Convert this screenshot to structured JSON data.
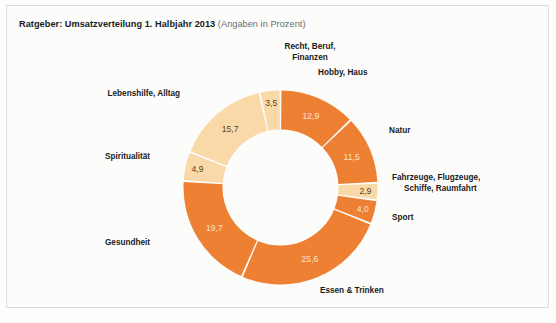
{
  "header": {
    "title_main": "Ratgeber: Umsatzverteilung 1. Halbjahr 2013",
    "title_sub": " (Angaben in Prozent)"
  },
  "colors": {
    "orange": "#ee8033",
    "peach": "#f9d9a8",
    "separator": "#ffffff",
    "hole": "#fcfcfb",
    "text_dark": "#1a1a1a",
    "text_muted": "#6e6e6e",
    "frame": "#dcdcdc",
    "value_on_orange": "#fbe3cb",
    "value_on_peach": "#5a4424"
  },
  "chart_data": {
    "type": "pie",
    "variant": "donut",
    "title": "Ratgeber: Umsatzverteilung 1. Halbjahr 2013",
    "subtitle": "(Angaben in Prozent)",
    "unit": "Prozent",
    "start_angle_deg": 0,
    "direction": "clockwise",
    "legend": "none",
    "labels_outside": true,
    "categories": [
      "Hobby, Haus",
      "Natur",
      "Fahrzeuge, Flugzeuge, Schiffe, Raumfahrt",
      "Sport",
      "Essen & Trinken",
      "Gesundheit",
      "Spiritualität",
      "Lebenshilfe, Alltag",
      "Recht, Beruf, Finanzen"
    ],
    "values": [
      12.9,
      11.5,
      2.9,
      4.0,
      25.6,
      19.7,
      4.9,
      15.7,
      3.5
    ],
    "value_labels": [
      "12,9",
      "11,5",
      "2,9",
      "4,0",
      "25,6",
      "19,7",
      "4,9",
      "15,7",
      "3,5"
    ],
    "slice_colors": [
      "#ee8033",
      "#ee8033",
      "#f9d9a8",
      "#ee8033",
      "#ee8033",
      "#ee8033",
      "#f9d9a8",
      "#f9d9a8",
      "#f9d9a8"
    ],
    "total": 100.7
  },
  "labels": [
    {
      "key": "hobby-haus",
      "text_line1": "Hobby, Haus",
      "text_line2": ""
    },
    {
      "key": "natur",
      "text_line1": "Natur",
      "text_line2": ""
    },
    {
      "key": "fahrzeuge",
      "text_line1": "Fahrzeuge, Flugzeuge,",
      "text_line2": "Schiffe, Raumfahrt"
    },
    {
      "key": "sport",
      "text_line1": "Sport",
      "text_line2": ""
    },
    {
      "key": "essen",
      "text_line1": "Essen & Trinken",
      "text_line2": ""
    },
    {
      "key": "gesundheit",
      "text_line1": "Gesundheit",
      "text_line2": ""
    },
    {
      "key": "spirit",
      "text_line1": "Spiritualität",
      "text_line2": ""
    },
    {
      "key": "lebenshilfe",
      "text_line1": "Lebenshilfe, Alltag",
      "text_line2": ""
    },
    {
      "key": "recht",
      "text_line1": "Recht, Beruf,",
      "text_line2": "Finanzen"
    }
  ]
}
